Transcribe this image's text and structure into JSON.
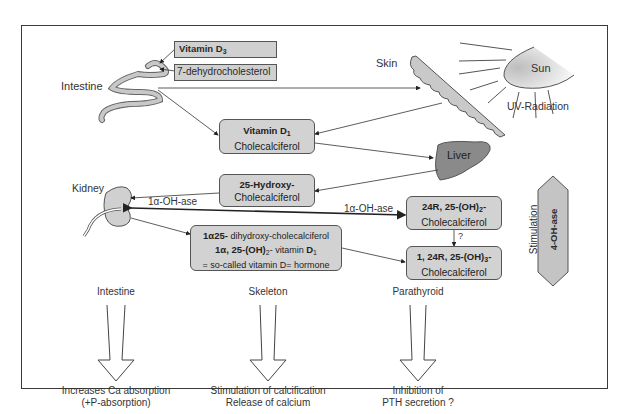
{
  "diagram": {
    "organs": {
      "intestine_top": "Intestine",
      "skin": "Skin",
      "sun": "Sun",
      "uv": "UV-Radiation",
      "liver": "Liver",
      "kidney": "Kidney"
    },
    "boxes": {
      "vitamin_d3": "Vitamin D",
      "vitamin_d3_sub": "3",
      "dehydro": "7-dehydrocholesterol",
      "vit_d1_line1": "Vitamin D",
      "vit_d1_sub": "1",
      "vit_d1_line2": "Cholecalciferol",
      "hydroxy_line1": "25-Hydroxy-",
      "hydroxy_line2": "Cholecalciferol",
      "calcitriol_line1_bold": "1α25-",
      "calcitriol_line1": " dihydroxy-cholecalciferol",
      "calcitriol_line2_bold": "1α, 25-(OH)",
      "calcitriol_line2_sub": "2",
      "calcitriol_line2_mid": "- vitamin ",
      "calcitriol_line2_end": "D",
      "calcitriol_line2_endsub": "1",
      "calcitriol_line3": "= so-called vitamin D= hormone",
      "r24_line1": "24R, 25-(OH)",
      "r24_sub": "2",
      "r24_dash": "-",
      "r24_line2": "Cholecalciferol",
      "tri_line1": "1, 24R, 25-(OH)",
      "tri_sub": "3",
      "tri_dash": "-",
      "tri_line2": "Cholecalciferol"
    },
    "enzymes": {
      "oh_ase_left": "1α-OH-ase",
      "oh_ase_right": "1α-OH-ase",
      "question": "?",
      "stimulation": "Stimulation",
      "four_oh_ase": "4-OH-ase"
    },
    "targets": [
      {
        "organ": "Intestine",
        "effect_line1": "Increases Ca absorption",
        "effect_line2": "(+P-absorption)"
      },
      {
        "organ": "Skeleton",
        "effect_line1": "Stimulation of calcification",
        "effect_line2": "Release of calcium"
      },
      {
        "organ": "Parathyroid",
        "effect_line1": "Inhibition of",
        "effect_line2": "PTH secretion ?"
      }
    ],
    "colors": {
      "box_fill": "#d2d2d2",
      "liver_fill": "#8a8a8a",
      "line": "#333333"
    }
  }
}
